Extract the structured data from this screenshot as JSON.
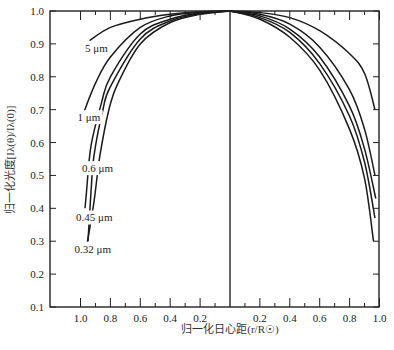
{
  "chart_data": {
    "type": "line",
    "title": "",
    "xlabel": "归一化日心距(r/R☉)",
    "ylabel": "归一化光度[Iλ(θ)/Iλ(0)]",
    "ylim": [
      0.1,
      1.0
    ],
    "xlim_left": [
      1.19,
      0
    ],
    "xlim_right": [
      0,
      1.0
    ],
    "grid": false,
    "legend": "inline-labels-left",
    "y_ticks": [
      {
        "value": 1.0,
        "label": "1.0"
      },
      {
        "value": 0.9,
        "label": "0.9"
      },
      {
        "value": 0.8,
        "label": "0.8"
      },
      {
        "value": 0.7,
        "label": "0.7"
      },
      {
        "value": 0.6,
        "label": "0.6"
      },
      {
        "value": 0.5,
        "label": "0.5"
      },
      {
        "value": 0.4,
        "label": "0.4"
      },
      {
        "value": 0.3,
        "label": "0.3"
      },
      {
        "value": 0.2,
        "label": "0.2"
      },
      {
        "value": 0.1,
        "label": "0.1"
      }
    ],
    "x_ticks_left": [
      {
        "value": 1.0,
        "label": "1.0"
      },
      {
        "value": 0.8,
        "label": "0.8"
      },
      {
        "value": 0.6,
        "label": "0.6"
      },
      {
        "value": 0.4,
        "label": "0.4"
      },
      {
        "value": 0.2,
        "label": "0.2"
      }
    ],
    "x_minor_ticks_left": [
      0.9,
      0.7,
      0.5,
      0.3,
      0.1
    ],
    "x_ticks_right": [
      {
        "value": 0.2,
        "label": "0.2"
      },
      {
        "value": 0.4,
        "label": "0.4"
      },
      {
        "value": 0.6,
        "label": "0.6"
      },
      {
        "value": 0.8,
        "label": "0.8"
      },
      {
        "value": 1.0,
        "label": "1.0"
      }
    ],
    "x_minor_ticks_right": [
      0.1,
      0.3,
      0.5,
      0.7,
      0.9
    ],
    "series_left": [
      {
        "name": "5 μm",
        "label_at": [
          0.97,
          0.875
        ],
        "points": [
          [
            0,
            1.0
          ],
          [
            0.2,
            0.998
          ],
          [
            0.4,
            0.99
          ],
          [
            0.6,
            0.975
          ],
          [
            0.8,
            0.95
          ],
          [
            0.94,
            0.91
          ]
        ]
      },
      {
        "name": "1 μm",
        "label_at": [
          1.02,
          0.665
        ],
        "points": [
          [
            0,
            1.0
          ],
          [
            0.2,
            0.996
          ],
          [
            0.4,
            0.985
          ],
          [
            0.6,
            0.95
          ],
          [
            0.8,
            0.86
          ],
          [
            0.9,
            0.78
          ],
          [
            0.98,
            0.69
          ]
        ]
      },
      {
        "name": "0.6 μm",
        "label_at": [
          0.99,
          0.51
        ],
        "points": [
          [
            0,
            1.0
          ],
          [
            0.2,
            0.994
          ],
          [
            0.4,
            0.975
          ],
          [
            0.6,
            0.93
          ],
          [
            0.8,
            0.8
          ],
          [
            0.86,
            0.72
          ],
          [
            0.93,
            0.59
          ],
          [
            0.96,
            0.45
          ],
          [
            0.97,
            0.4
          ]
        ]
      },
      {
        "name": "0.45 μm",
        "label_at": [
          1.03,
          0.36
        ],
        "points": [
          [
            0,
            1.0
          ],
          [
            0.2,
            0.992
          ],
          [
            0.4,
            0.97
          ],
          [
            0.6,
            0.915
          ],
          [
            0.8,
            0.77
          ],
          [
            0.85,
            0.7
          ],
          [
            0.91,
            0.56
          ],
          [
            0.93,
            0.45
          ],
          [
            0.95,
            0.3
          ]
        ]
      },
      {
        "name": "0.32 μm",
        "label_at": [
          1.04,
          0.265
        ],
        "points": [
          [
            0,
            1.0
          ],
          [
            0.2,
            0.99
          ],
          [
            0.4,
            0.965
          ],
          [
            0.6,
            0.9
          ],
          [
            0.75,
            0.78
          ],
          [
            0.81,
            0.7
          ],
          [
            0.87,
            0.56
          ],
          [
            0.91,
            0.42
          ],
          [
            0.96,
            0.28
          ]
        ]
      }
    ],
    "series_right": [
      {
        "name": "5 μm",
        "points": [
          [
            0,
            1.0
          ],
          [
            0.2,
            0.995
          ],
          [
            0.4,
            0.98
          ],
          [
            0.6,
            0.94
          ],
          [
            0.8,
            0.87
          ],
          [
            0.9,
            0.81
          ],
          [
            0.97,
            0.7
          ]
        ]
      },
      {
        "name": "1 μm",
        "points": [
          [
            0,
            1.0
          ],
          [
            0.2,
            0.99
          ],
          [
            0.4,
            0.96
          ],
          [
            0.6,
            0.89
          ],
          [
            0.8,
            0.76
          ],
          [
            0.9,
            0.64
          ],
          [
            0.97,
            0.5
          ]
        ]
      },
      {
        "name": "0.6 μm",
        "points": [
          [
            0,
            1.0
          ],
          [
            0.2,
            0.985
          ],
          [
            0.4,
            0.945
          ],
          [
            0.6,
            0.86
          ],
          [
            0.8,
            0.71
          ],
          [
            0.9,
            0.58
          ],
          [
            0.975,
            0.43
          ]
        ]
      },
      {
        "name": "0.45 μm",
        "points": [
          [
            0,
            1.0
          ],
          [
            0.2,
            0.98
          ],
          [
            0.4,
            0.935
          ],
          [
            0.6,
            0.84
          ],
          [
            0.8,
            0.68
          ],
          [
            0.9,
            0.54
          ],
          [
            0.97,
            0.37
          ]
        ]
      },
      {
        "name": "0.32 μm",
        "points": [
          [
            0,
            1.0
          ],
          [
            0.2,
            0.975
          ],
          [
            0.4,
            0.92
          ],
          [
            0.6,
            0.82
          ],
          [
            0.8,
            0.64
          ],
          [
            0.9,
            0.49
          ],
          [
            0.96,
            0.3
          ]
        ]
      }
    ]
  }
}
